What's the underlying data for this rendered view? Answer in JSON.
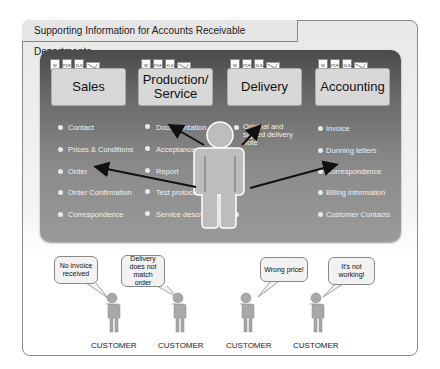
{
  "title": "Supporting Information for Accounts Receivable Departments",
  "departments": [
    {
      "name": "Sales",
      "items": [
        "Contact",
        "Prices & Conditions",
        "Order",
        "Order Confirmation",
        "Correspondence"
      ]
    },
    {
      "name": "Production/ Service",
      "items": [
        "Documentation",
        "Acceptance",
        "Report",
        "Test protocol",
        "Service description"
      ]
    },
    {
      "name": "Delivery",
      "items": [
        "Original and signed delivery note"
      ]
    },
    {
      "name": "Accounting",
      "items": [
        "Invoice",
        "Dunning letters",
        "Correspondence",
        "Billing information",
        "Customer Contacts"
      ]
    }
  ],
  "doc_icons": [
    "DOC",
    "PDF",
    "XLS",
    "mail"
  ],
  "customers": [
    {
      "label": "CUSTOMER",
      "speech": "No invoice received"
    },
    {
      "label": "CUSTOMER",
      "speech": "Delivery does not match order"
    },
    {
      "label": "CUSTOMER",
      "speech": "Wrong price!"
    },
    {
      "label": "CUSTOMER",
      "speech": "It's not working!"
    }
  ],
  "colors": {
    "panel_dark": "#4a4a4a",
    "panel_light": "#9a9a9a",
    "dept_box": "#d8d8d8",
    "person": "#b5b5b5"
  }
}
